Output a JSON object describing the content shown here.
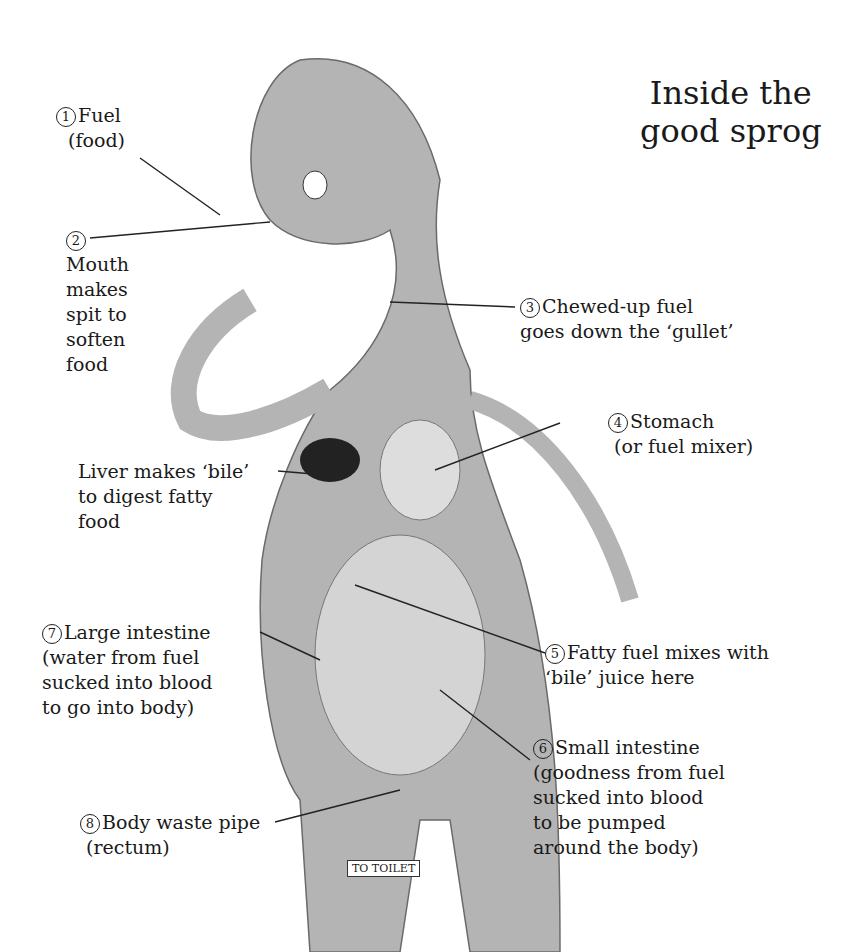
{
  "title": [
    "Inside the",
    "good sprog"
  ],
  "labels": [
    {
      "num": "1",
      "lines": [
        "Fuel",
        "(food)"
      ]
    },
    {
      "num": "2",
      "lines": [
        "Mouth",
        "makes",
        "spit to",
        "soften",
        "food"
      ]
    },
    {
      "num": "3",
      "lines": [
        "Chewed-up fuel",
        "goes down the ‘gullet’"
      ]
    },
    {
      "num": "4",
      "lines": [
        "Stomach",
        "(or fuel mixer)"
      ]
    },
    {
      "num": "",
      "lines": [
        "Liver makes ‘bile’",
        "to digest fatty",
        "food"
      ]
    },
    {
      "num": "5",
      "lines": [
        "Fatty fuel mixes with",
        "‘bile’ juice here"
      ]
    },
    {
      "num": "6",
      "lines": [
        "Small intestine",
        "(goodness from fuel",
        "sucked into blood",
        "to be pumped",
        "around the body)"
      ]
    },
    {
      "num": "7",
      "lines": [
        "Large intestine",
        "(water from fuel",
        "sucked into blood",
        "to go into body)"
      ]
    },
    {
      "num": "8",
      "lines": [
        "Body waste pipe",
        "(rectum)"
      ]
    }
  ],
  "sign": "TO TOILET"
}
